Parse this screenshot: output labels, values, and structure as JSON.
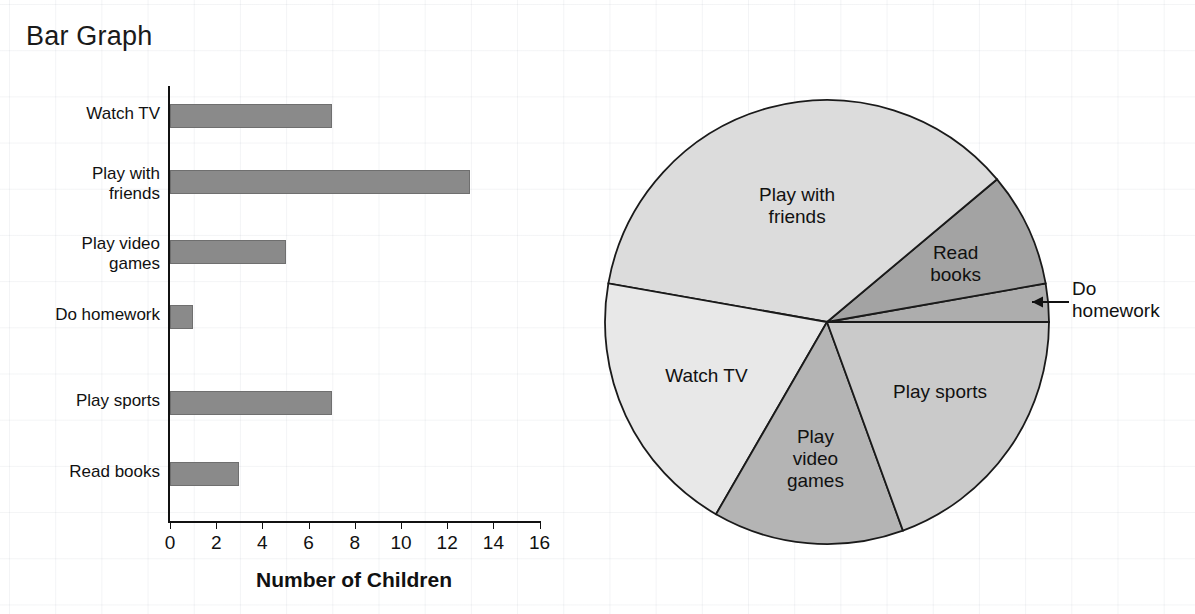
{
  "bar_panel": {
    "title": "Bar Graph",
    "x_axis_title": "Number of Children",
    "x_ticks": [
      0,
      2,
      4,
      6,
      8,
      10,
      12,
      14,
      16
    ],
    "categories": [
      "Watch TV",
      "Play with\nfriends",
      "Play video\ngames",
      "Do homework",
      "Play sports",
      "Read books"
    ],
    "values": [
      7,
      13,
      5,
      1,
      7,
      3
    ],
    "bar_color": "#8a8a8a",
    "axis_color": "#111111"
  },
  "pie_panel": {
    "title": "Circle Graph",
    "callout_label": "Do\nhomework",
    "slices": [
      {
        "label": "Do homework",
        "value": 1,
        "color": "#adadad",
        "shown_in_pie": false
      },
      {
        "label": "Read\nbooks",
        "value": 3,
        "color": "#a3a3a3",
        "shown_in_pie": true
      },
      {
        "label": "Play with\nfriends",
        "value": 13,
        "color": "#dcdcdc",
        "shown_in_pie": true
      },
      {
        "label": "Watch TV",
        "value": 7,
        "color": "#e8e8e8",
        "shown_in_pie": true
      },
      {
        "label": "Play\nvideo\ngames",
        "value": 5,
        "color": "#b4b4b4",
        "shown_in_pie": true
      },
      {
        "label": "Play sports",
        "value": 7,
        "color": "#cacaca",
        "shown_in_pie": true
      }
    ]
  },
  "chart_data": [
    {
      "type": "bar",
      "orientation": "horizontal",
      "title": "Bar Graph",
      "xlabel": "Number of Children",
      "ylabel": "",
      "categories": [
        "Watch TV",
        "Play with friends",
        "Play video games",
        "Do homework",
        "Play sports",
        "Read books"
      ],
      "values": [
        7,
        13,
        5,
        1,
        7,
        3
      ],
      "xlim": [
        0,
        16
      ],
      "xticks": [
        0,
        2,
        4,
        6,
        8,
        10,
        12,
        14,
        16
      ],
      "grid": false,
      "legend": "none"
    },
    {
      "type": "pie",
      "title": "Circle Graph",
      "categories": [
        "Do homework",
        "Read books",
        "Play with friends",
        "Watch TV",
        "Play video games",
        "Play sports"
      ],
      "values": [
        1,
        3,
        13,
        7,
        5,
        7
      ],
      "total": 36,
      "degrees_per_unit": 10,
      "slice_degrees": [
        10,
        30,
        130,
        70,
        50,
        70
      ],
      "start_angle_deg": 0,
      "direction": "counterclockwise",
      "annotations": [
        "Do homework (leader line with arrow pointing to thin slice)"
      ],
      "legend": "none"
    }
  ]
}
